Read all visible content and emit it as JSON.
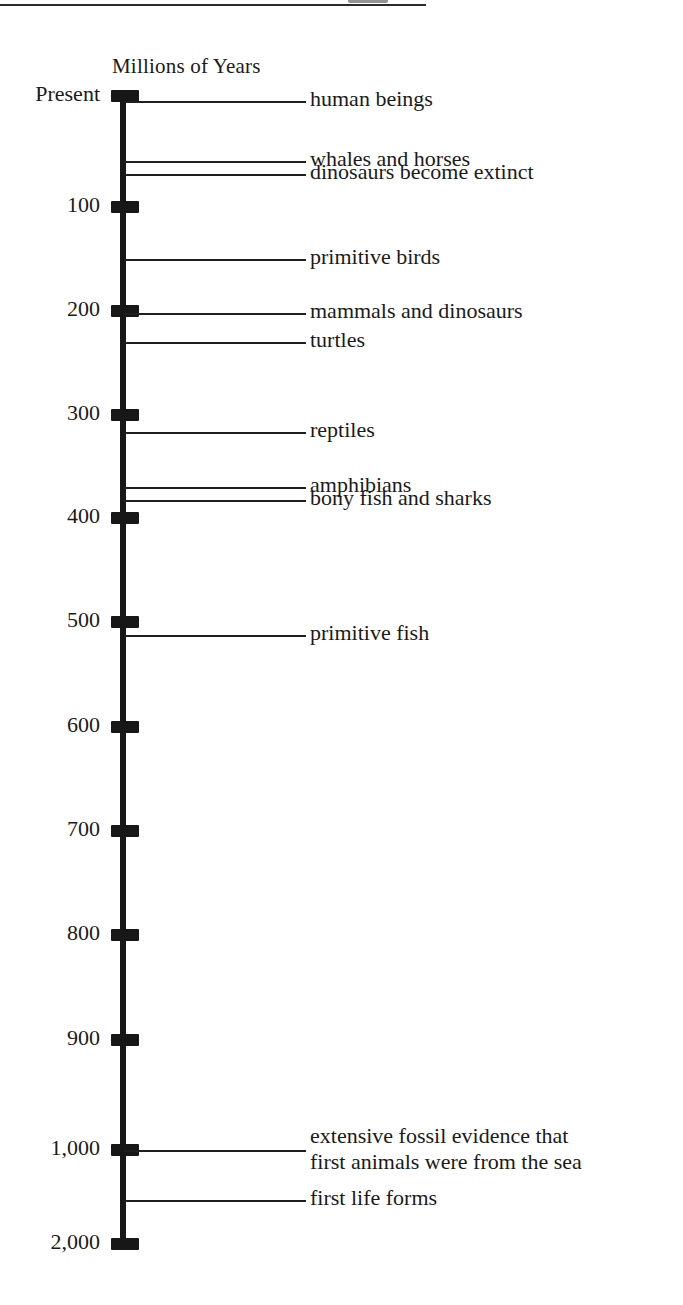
{
  "page": {
    "top_rule": true,
    "clipped_header_fragment": "gy"
  },
  "chart_data": {
    "type": "timeline",
    "title": "Millions of Years",
    "ylabel": "Millions of Years",
    "orientation": "vertical",
    "axis_note": "Non-linear compressed scale below 1,000",
    "grid": false,
    "legend": "none",
    "axis_ticks": [
      {
        "label": "Present",
        "value": 0,
        "y": 96
      },
      {
        "label": "100",
        "value": 100,
        "y": 207
      },
      {
        "label": "200",
        "value": 200,
        "y": 311
      },
      {
        "label": "300",
        "value": 300,
        "y": 415
      },
      {
        "label": "400",
        "value": 400,
        "y": 518
      },
      {
        "label": "500",
        "value": 500,
        "y": 622
      },
      {
        "label": "600",
        "value": 600,
        "y": 727
      },
      {
        "label": "700",
        "value": 700,
        "y": 831
      },
      {
        "label": "800",
        "value": 800,
        "y": 935
      },
      {
        "label": "900",
        "value": 900,
        "y": 1040
      },
      {
        "label": "1,000",
        "value": 1000,
        "y": 1150
      },
      {
        "label": "2,000",
        "value": 2000,
        "y": 1244
      }
    ],
    "events": [
      {
        "label": "human beings",
        "value": 2,
        "y": 101,
        "leader_width": 182
      },
      {
        "label": "whales and horses",
        "value": 60,
        "y": 161,
        "leader_width": 182
      },
      {
        "label": "dinosaurs become extinct",
        "value": 70,
        "y": 174,
        "leader_width": 182
      },
      {
        "label": "primitive birds",
        "value": 145,
        "y": 259,
        "leader_width": 182
      },
      {
        "label": "mammals and dinosaurs",
        "value": 200,
        "y": 313,
        "leader_width": 182
      },
      {
        "label": "turtles",
        "value": 225,
        "y": 342,
        "leader_width": 182
      },
      {
        "label": "reptiles",
        "value": 315,
        "y": 432,
        "leader_width": 182
      },
      {
        "label": "amphibians",
        "value": 370,
        "y": 487,
        "leader_width": 182
      },
      {
        "label": "bony fish and sharks",
        "value": 385,
        "y": 500,
        "leader_width": 182
      },
      {
        "label": "primitive fish",
        "value": 510,
        "y": 635,
        "leader_width": 182
      },
      {
        "label": "extensive fossil evidence that",
        "label2": "first animals were from the sea",
        "value": 1000,
        "y": 1150,
        "leader_width": 182
      },
      {
        "label": "first life forms",
        "value": 1500,
        "y": 1200,
        "leader_width": 182
      }
    ]
  }
}
